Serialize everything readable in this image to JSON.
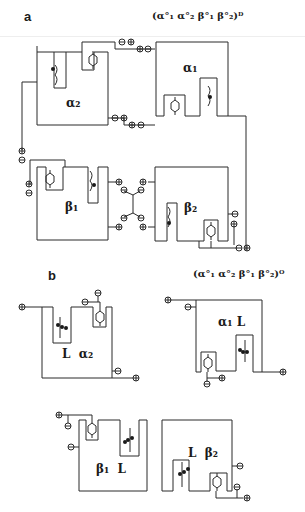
{
  "figure": {
    "panels": [
      {
        "id": "a",
        "label": "a",
        "formula": "(α°₁ α°₂ β°₁ β°₂)ᴰ",
        "subunits": [
          {
            "name": "α1",
            "label": "α₁"
          },
          {
            "name": "α2",
            "label": "α₂"
          },
          {
            "name": "β1",
            "label": "β₁"
          },
          {
            "name": "β2",
            "label": "β₂"
          }
        ]
      },
      {
        "id": "b",
        "label": "b",
        "formula": "(α°₁ α°₂ β°₁ β°₂)ᴼ",
        "subunits": [
          {
            "name": "α2L",
            "label": "L  α₂"
          },
          {
            "name": "α1L",
            "label": "α₁ L"
          },
          {
            "name": "β1L",
            "label": "β₁  L"
          },
          {
            "name": "β2L",
            "label": "L  β₂"
          }
        ]
      }
    ],
    "charge_symbols": {
      "plus": "⊕",
      "minus": "⊖"
    }
  }
}
